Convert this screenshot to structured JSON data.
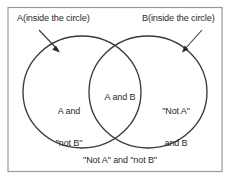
{
  "diagram": {
    "type": "venn",
    "universe": {
      "name": "universal-set-rectangle",
      "label": "\"Not A\" and \"not B\""
    },
    "callouts": [
      {
        "name": "set-a-callout",
        "text": "A(inside the circle)",
        "points_to": "set-a-circle"
      },
      {
        "name": "set-b-callout",
        "text": "B(inside the circle)",
        "points_to": "set-b-circle"
      }
    ],
    "regions": [
      {
        "name": "a-only",
        "line1": "A and",
        "line2": "\"not B\"",
        "text": "A and \"not B\""
      },
      {
        "name": "intersection",
        "line1": "A and B",
        "line2": "",
        "text": "A and B"
      },
      {
        "name": "b-only",
        "line1": "\"Not A\"",
        "line2": "and B",
        "text": "\"Not A\" and B"
      }
    ],
    "colors": {
      "stroke": "#3a3a3a",
      "border": "#9a9a9a",
      "text": "#2b2b2b",
      "background": "#ffffff"
    }
  }
}
